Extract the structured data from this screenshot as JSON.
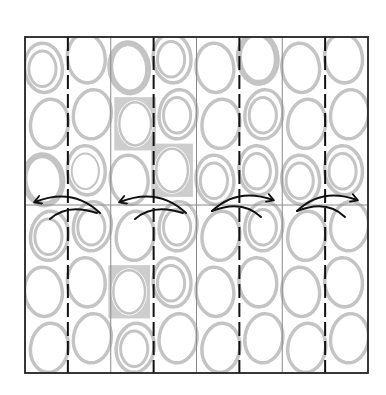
{
  "diagram": {
    "kind": "origami-pleat-fold-step",
    "colors": {
      "background": "#ffffff",
      "outline": "#222222",
      "valley_fold": "#111111",
      "crease": "#8a8a8a",
      "pattern": "#c4c4c4",
      "arrow": "#111111"
    },
    "paper": {
      "pattern": "circles-and-squares",
      "columns": 8,
      "rows_per_column": 6
    },
    "vertical_lines": [
      {
        "type": "valley-fold-dashed"
      },
      {
        "type": "existing-crease"
      },
      {
        "type": "valley-fold-dashed"
      },
      {
        "type": "existing-crease"
      },
      {
        "type": "valley-fold-dashed"
      },
      {
        "type": "existing-crease"
      },
      {
        "type": "valley-fold-dashed"
      }
    ],
    "horizontal_lines": [
      {
        "type": "existing-crease"
      }
    ],
    "arrows": [
      {
        "direction": "left",
        "meaning": "fold-over"
      },
      {
        "direction": "left",
        "meaning": "fold-over"
      },
      {
        "direction": "right",
        "meaning": "fold-over"
      },
      {
        "direction": "right",
        "meaning": "fold-over"
      }
    ],
    "pattern_cells": [
      [
        "ring-double",
        "ring",
        "ring-thick",
        "ring-double",
        "ring",
        "ring"
      ],
      [
        "ring",
        "ring",
        "ring-double-thin",
        "ring-double",
        "ring",
        "ring"
      ],
      [
        "ring-thick",
        "square-ring",
        "ring",
        "ring",
        "square-ring",
        "ring-double"
      ],
      [
        "ring-double",
        "ring-double",
        "square-ring",
        "ring-double",
        "ring-double",
        "ring"
      ],
      [
        "ring",
        "ring",
        "ring-double",
        "ring",
        "ring",
        "ring"
      ],
      [
        "ring-thick",
        "ring-double",
        "ring-double",
        "ring-double",
        "ring",
        "ring"
      ],
      [
        "ring",
        "ring",
        "ring-double",
        "ring",
        "ring",
        "ring"
      ],
      [
        "ring",
        "ring",
        "ring-double",
        "ring",
        "ring",
        "ring"
      ]
    ]
  }
}
